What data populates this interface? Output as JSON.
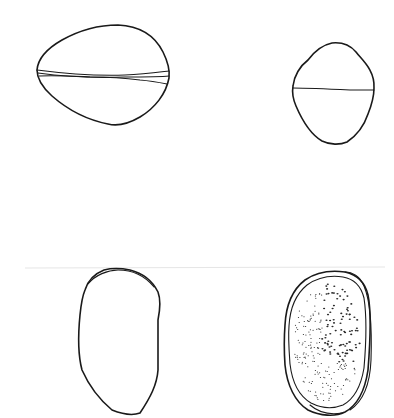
{
  "figure": {
    "type": "line-drawing",
    "background": "#ffffff",
    "ink_color": "#1a1a1a",
    "panels": [
      {
        "id": "top-left",
        "description": "broad ellipsoid grain, equatorial view with double suture band"
      },
      {
        "id": "top-right",
        "description": "small rounded grain, equatorial view with single suture line"
      },
      {
        "id": "bottom-left",
        "description": "elongated oval grain, outline only"
      },
      {
        "id": "bottom-right",
        "description": "elongated oval grain with double wall and stippled surface"
      }
    ]
  }
}
